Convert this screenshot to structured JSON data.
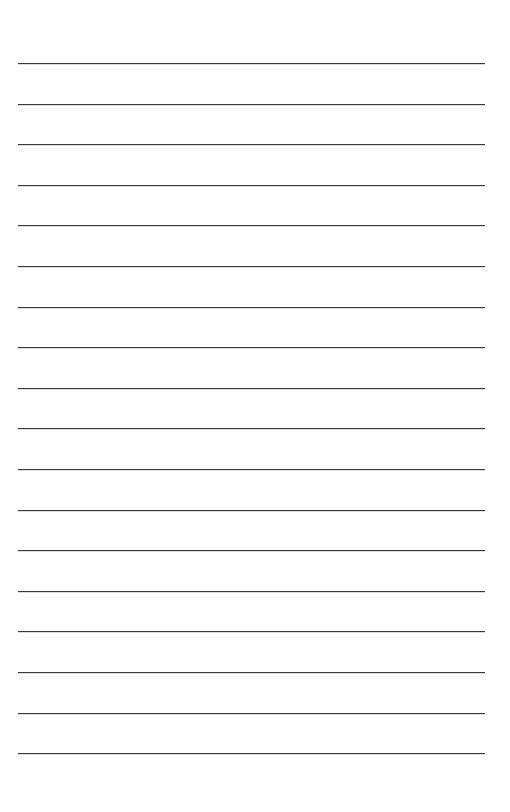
{
  "document": {
    "type": "lined-paper",
    "background_color": "#ffffff",
    "line_color": "#3a3a3a",
    "line_count": 18,
    "first_line_y": 63,
    "line_spacing": 40.6,
    "line_left": 18,
    "line_width": 467,
    "lines": [
      {
        "text": ""
      },
      {
        "text": ""
      },
      {
        "text": ""
      },
      {
        "text": ""
      },
      {
        "text": ""
      },
      {
        "text": ""
      },
      {
        "text": ""
      },
      {
        "text": ""
      },
      {
        "text": ""
      },
      {
        "text": ""
      },
      {
        "text": ""
      },
      {
        "text": ""
      },
      {
        "text": ""
      },
      {
        "text": ""
      },
      {
        "text": ""
      },
      {
        "text": ""
      },
      {
        "text": ""
      },
      {
        "text": ""
      }
    ]
  }
}
